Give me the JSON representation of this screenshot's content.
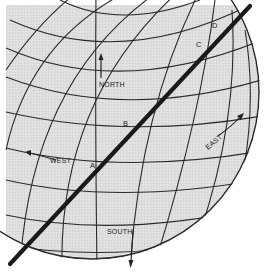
{
  "diagram": {
    "type": "globe-graticule",
    "colors": {
      "globe_fill": "#dcdcdc",
      "grid_line": "#2a2a2a",
      "path_line": "#1a1a1a",
      "background": "#ffffff"
    },
    "points": [
      {
        "label": "A",
        "x": 92,
        "y": 166
      },
      {
        "label": "B",
        "x": 125,
        "y": 125
      },
      {
        "label": "C",
        "x": 199,
        "y": 46
      },
      {
        "label": "D",
        "x": 214,
        "y": 27
      }
    ],
    "directions": {
      "north": "NORTH",
      "south": "SOUTH",
      "east": "EAST",
      "west": "WEST"
    }
  }
}
